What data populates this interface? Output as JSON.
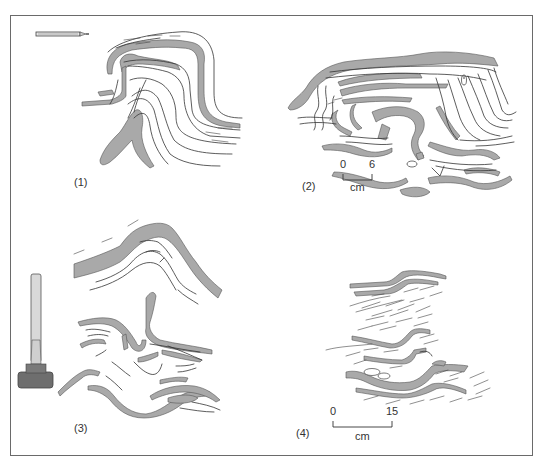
{
  "figure": {
    "panels": [
      {
        "id": "1",
        "label": "(1)",
        "scale_object": "pencil"
      },
      {
        "id": "2",
        "label": "(2)",
        "scale": {
          "start": "0",
          "end": "6",
          "unit": "cm"
        }
      },
      {
        "id": "3",
        "label": "(3)",
        "scale_object": "hammer"
      },
      {
        "id": "4",
        "label": "(4)",
        "scale": {
          "start": "0",
          "end": "15",
          "unit": "cm"
        }
      }
    ],
    "colors": {
      "layer_fill": "#a9a9a9",
      "line": "#333333",
      "frame": "#6a6a6a",
      "hammer_handle": "#d9d9d9",
      "hammer_head": "#6e6e6e"
    }
  }
}
